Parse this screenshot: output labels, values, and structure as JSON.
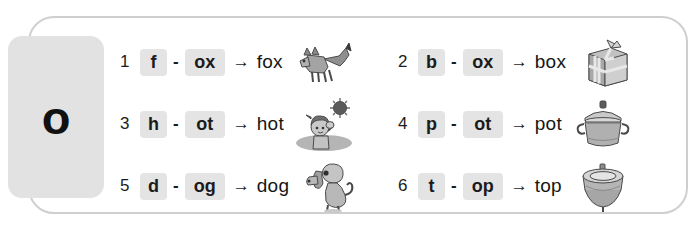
{
  "worksheet": {
    "focus_letter": "o",
    "rows": [
      {
        "number": "1",
        "onset": "f",
        "dash": "-",
        "rime": "ox",
        "arrow": "→",
        "word": "fox",
        "picture": "fox-illustration"
      },
      {
        "number": "2",
        "onset": "b",
        "dash": "-",
        "rime": "ox",
        "arrow": "→",
        "word": "box",
        "picture": "gift-box-illustration"
      },
      {
        "number": "3",
        "onset": "h",
        "dash": "-",
        "rime": "ot",
        "arrow": "→",
        "word": "hot",
        "picture": "hot-sun-child-illustration"
      },
      {
        "number": "4",
        "onset": "p",
        "dash": "-",
        "rime": "ot",
        "arrow": "→",
        "word": "pot",
        "picture": "cooking-pot-illustration"
      },
      {
        "number": "5",
        "onset": "d",
        "dash": "-",
        "rime": "og",
        "arrow": "→",
        "word": "dog",
        "picture": "dog-illustration"
      },
      {
        "number": "6",
        "onset": "t",
        "dash": "-",
        "rime": "op",
        "arrow": "→",
        "word": "top",
        "picture": "spinning-top-illustration"
      }
    ]
  },
  "colors": {
    "frame_border": "#cfcfcf",
    "panel_bg": "#e2e2e2",
    "chip_bg": "#e4e4e4",
    "text": "#1b1b1b",
    "page_bg": "#ffffff"
  }
}
